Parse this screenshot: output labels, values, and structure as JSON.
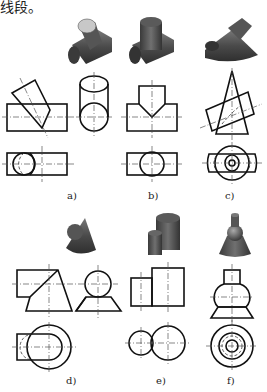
{
  "header": {
    "text": "线段。"
  },
  "figures": [
    {
      "id": "a",
      "label": "a)",
      "description": "inclined cylinder intersecting horizontal cylinder"
    },
    {
      "id": "b",
      "label": "b)",
      "description": "vertical cylinder intersecting horizontal cylinder (T-joint)"
    },
    {
      "id": "c",
      "label": "c)",
      "description": "inclined cylinder intersecting cone"
    },
    {
      "id": "d",
      "label": "d)",
      "description": "horizontal cylinder intersecting truncated cone"
    },
    {
      "id": "e",
      "label": "e)",
      "description": "two vertical cylinders side by side"
    },
    {
      "id": "f",
      "label": "f)",
      "description": "coaxial cylinder, sphere and truncated cone"
    }
  ],
  "colors": {
    "line": "#111111",
    "centerline": "#555555",
    "render_dark": "#3d3d3d",
    "render_mid": "#6a6a6a",
    "render_light": "#b8b8b8"
  }
}
